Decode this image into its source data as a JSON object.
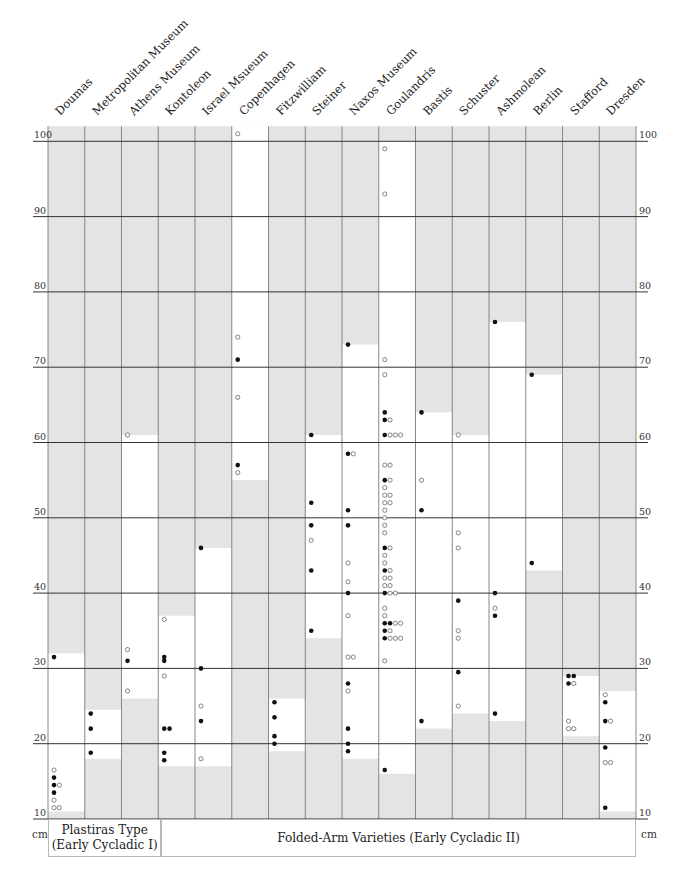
{
  "chart_data": {
    "type": "scatter",
    "title": "",
    "ylabel": "cm",
    "ylim": [
      10,
      100
    ],
    "yticks": [
      10,
      20,
      30,
      40,
      50,
      60,
      70,
      80,
      90,
      100
    ],
    "ytick_labels": [
      "10",
      "20",
      "30",
      "40",
      "50",
      "60",
      "70",
      "80",
      "90",
      "100"
    ],
    "grid": true,
    "legend": {
      "filled_dot": "figure (filled marker)",
      "open_dot": "figure (open marker)"
    },
    "groups": [
      {
        "label_line1": "Plastiras Type",
        "label_line2": "(Early Cycladic I)",
        "columns": [
          0
        ]
      },
      {
        "label": "Folded-Arm Varieties (Early Cycladic II)",
        "columns": [
          1,
          2,
          3,
          4,
          5,
          6,
          7,
          8,
          9,
          10,
          11,
          12,
          13,
          14,
          15
        ]
      }
    ],
    "categories": [
      "Doumas",
      "Metropolitan Museum",
      "Athens Museum",
      "Kontoleon",
      "Israel Msueum",
      "Copenhagen",
      "Fitzwilliam",
      "Steiner",
      "Naxos Museum",
      "Goulandris",
      "Bastis",
      "Schuster",
      "Ashmolean",
      "Berlin",
      "Stafford",
      "Dresden"
    ],
    "series": [
      {
        "name": "Doumas",
        "range": [
          11,
          32
        ],
        "filled": [
          31.5,
          15.5,
          14.5,
          13.5
        ],
        "open": [
          16.5,
          14.5,
          12.5,
          11.5,
          11.5
        ]
      },
      {
        "name": "Metropolitan Museum",
        "range": [
          18,
          24.5
        ],
        "filled": [
          24,
          22,
          18.8
        ],
        "open": []
      },
      {
        "name": "Athens Museum",
        "range": [
          26,
          61
        ],
        "filled": [
          31
        ],
        "open": [
          61,
          32.5,
          27
        ]
      },
      {
        "name": "Kontoleon",
        "range": [
          17,
          37
        ],
        "filled": [
          31.5,
          31,
          22,
          22,
          18.8,
          17.8
        ],
        "open": [
          36.5,
          29
        ]
      },
      {
        "name": "Israel Msueum",
        "range": [
          17,
          46
        ],
        "filled": [
          46,
          30,
          23
        ],
        "open": [
          25,
          18
        ]
      },
      {
        "name": "Copenhagen",
        "range": [
          55,
          102
        ],
        "filled": [
          71,
          57
        ],
        "open": [
          101,
          74,
          66,
          56
        ]
      },
      {
        "name": "Fitzwilliam",
        "range": [
          19,
          26
        ],
        "filled": [
          25.5,
          23.5,
          21,
          20
        ],
        "open": []
      },
      {
        "name": "Steiner",
        "range": [
          34,
          61
        ],
        "filled": [
          61,
          52,
          49,
          43,
          35
        ],
        "open": [
          47
        ]
      },
      {
        "name": "Naxos Museum",
        "range": [
          18,
          73
        ],
        "filled": [
          73,
          58.5,
          51,
          49,
          40,
          28,
          22,
          20,
          19
        ],
        "open": [
          58.5,
          44,
          41.5,
          37,
          31.5,
          31.5,
          27
        ]
      },
      {
        "name": "Goulandris",
        "range": [
          16,
          100
        ],
        "filled": [
          64,
          63,
          61,
          55,
          46,
          43,
          40,
          36,
          36,
          35,
          34,
          16.5
        ],
        "open": [
          99,
          93,
          71,
          69,
          63,
          61,
          61,
          61,
          57,
          57,
          55,
          54,
          53,
          53,
          52,
          52,
          51,
          50,
          49,
          48,
          46,
          45,
          44,
          43,
          42,
          42,
          41,
          41,
          40,
          40,
          38,
          37,
          36,
          36,
          35,
          34,
          34,
          34,
          31
        ]
      },
      {
        "name": "Bastis",
        "range": [
          22,
          64
        ],
        "filled": [
          64,
          51,
          23
        ],
        "open": [
          55
        ]
      },
      {
        "name": "Schuster",
        "range": [
          24,
          61
        ],
        "filled": [
          39,
          29.5
        ],
        "open": [
          61,
          48,
          46,
          35,
          34,
          25
        ]
      },
      {
        "name": "Ashmolean",
        "range": [
          23,
          76
        ],
        "filled": [
          76,
          40,
          37,
          24
        ],
        "open": [
          38
        ]
      },
      {
        "name": "Berlin",
        "range": [
          43,
          69
        ],
        "filled": [
          69,
          44
        ],
        "open": []
      },
      {
        "name": "Stafford",
        "range": [
          21,
          29
        ],
        "filled": [
          29,
          29,
          28
        ],
        "open": [
          28,
          23,
          22,
          22
        ]
      },
      {
        "name": "Dresden",
        "range": [
          11,
          27
        ],
        "filled": [
          25.5,
          23,
          19.5,
          11.5
        ],
        "open": [
          26.5,
          23,
          17.5,
          17.5
        ]
      }
    ]
  },
  "axis": {
    "unit_left": "cm",
    "unit_right": "cm"
  },
  "colors": {
    "shade": "#e4e4e4",
    "range": "#ffffff",
    "line": "#333333",
    "colline": "#7a7a7a",
    "dot": "#111111"
  }
}
